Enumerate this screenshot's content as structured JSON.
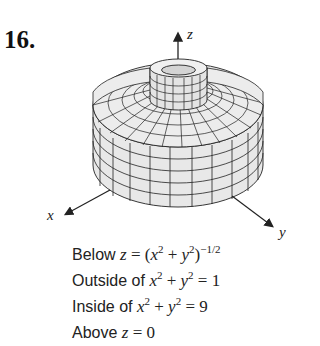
{
  "problem": {
    "number": "16."
  },
  "figure": {
    "axes": {
      "x_label": "x",
      "y_label": "y",
      "z_label": "z"
    },
    "colors": {
      "surface_fill": "#e6e6e6",
      "mesh_line": "#222222",
      "axis": "#222222"
    }
  },
  "conditions": [
    {
      "prefix": "Below ",
      "math": "z = (x² + y²)^(−1/2)"
    },
    {
      "prefix": "Outside of ",
      "math": "x² + y² = 1"
    },
    {
      "prefix": "Inside of ",
      "math": "x² + y² = 9"
    },
    {
      "prefix": "Above ",
      "math": "z = 0"
    }
  ]
}
